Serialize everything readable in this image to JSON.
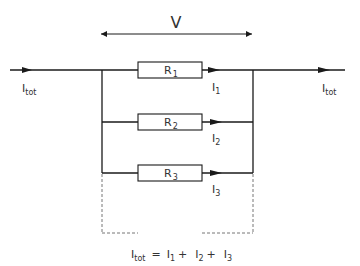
{
  "diagram": {
    "type": "parallel-resistor-circuit",
    "voltage_label": "V",
    "input_current": {
      "main": "I",
      "sub": "tot"
    },
    "output_current": {
      "main": "I",
      "sub": "tot"
    },
    "branches": [
      {
        "resistor": {
          "main": "R",
          "sub": "1"
        },
        "current": {
          "main": "I",
          "sub": "1"
        }
      },
      {
        "resistor": {
          "main": "R",
          "sub": "2"
        },
        "current": {
          "main": "I",
          "sub": "2"
        }
      },
      {
        "resistor": {
          "main": "R",
          "sub": "3"
        },
        "current": {
          "main": "I",
          "sub": "3"
        }
      }
    ],
    "equation": {
      "lhs_main": "I",
      "lhs_sub": "tot",
      "equals": "=",
      "terms": [
        {
          "main": "I",
          "sub": "1",
          "op": "+"
        },
        {
          "main": "I",
          "sub": "2",
          "op": "+"
        },
        {
          "main": "I",
          "sub": "3",
          "op": ""
        }
      ]
    },
    "colors": {
      "line": "#1a1a1a",
      "text": "#333333",
      "dashed": "#777777"
    }
  }
}
